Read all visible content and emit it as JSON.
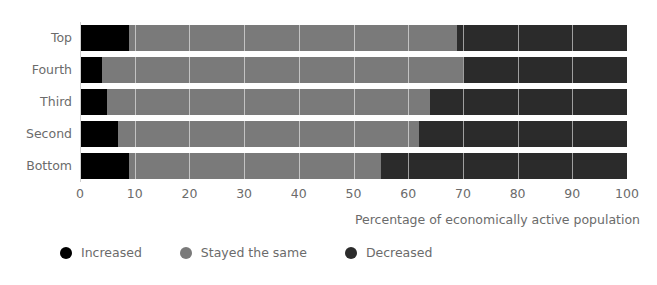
{
  "chart_data": {
    "type": "bar",
    "orientation": "horizontal",
    "stacked": true,
    "stacked_mode": "percent",
    "title": "",
    "subtitle": "",
    "xlabel": "Percentage of economically active population",
    "ylabel": "",
    "categories": [
      "Top",
      "Fourth",
      "Third",
      "Second",
      "Bottom"
    ],
    "series": [
      {
        "name": "Increased",
        "color": "#000000",
        "values": [
          9,
          4,
          5,
          7,
          9
        ]
      },
      {
        "name": "Stayed the same",
        "color": "#7a7a7a",
        "values": [
          60,
          66,
          59,
          55,
          46
        ]
      },
      {
        "name": "Decreased",
        "color": "#2b2b2b",
        "values": [
          31,
          30,
          36,
          38,
          45
        ]
      }
    ],
    "xlim": [
      0,
      100
    ],
    "xticks": [
      0,
      10,
      20,
      30,
      40,
      50,
      60,
      70,
      80,
      90,
      100
    ],
    "xticklabels": [
      "0",
      "10",
      "20",
      "30",
      "40",
      "50",
      "60",
      "70",
      "80",
      "90",
      "100"
    ],
    "grid": true,
    "grid_axis": "x",
    "legend_position": "bottom-left",
    "cumulative_boundaries": {
      "Top": [
        9,
        69
      ],
      "Fourth": [
        4,
        70
      ],
      "Third": [
        5,
        64
      ],
      "Second": [
        7,
        62
      ],
      "Bottom": [
        9,
        55
      ]
    }
  },
  "legend": {
    "items": [
      {
        "label": "Increased",
        "marker": "circle-marker-increased"
      },
      {
        "label": "Stayed the same",
        "marker": "circle-marker-stayed-the-same"
      },
      {
        "label": "Decreased",
        "marker": "circle-marker-decreased"
      }
    ]
  },
  "colors": {
    "increased": "#000000",
    "stayed_the_same": "#7a7a7a",
    "decreased": "#2b2b2b",
    "text": "#6b6b6b",
    "background": "#ffffff",
    "axis": "#cfcfcf"
  }
}
